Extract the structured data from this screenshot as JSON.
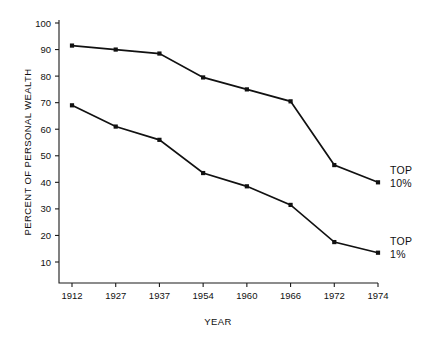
{
  "chart_data": {
    "type": "line",
    "title": "",
    "xlabel": "YEAR",
    "ylabel": "PERCENT OF PERSONAL WEALTH",
    "categories": [
      "1912",
      "1927",
      "1937",
      "1954",
      "1960",
      "1966",
      "1972",
      "1974"
    ],
    "ylim": [
      0,
      100
    ],
    "yticks": [
      10,
      20,
      30,
      40,
      50,
      60,
      70,
      80,
      90,
      100
    ],
    "ytick_labels": [
      "10",
      "20",
      "30",
      "40",
      "50",
      "60",
      "70",
      "80",
      "90",
      "100"
    ],
    "grid": false,
    "legend_position": "right-inline",
    "series": [
      {
        "name": "TOP 10%",
        "label_line1": "TOP",
        "label_line2": "10%",
        "color": "#111111",
        "values": [
          91.5,
          90,
          88.5,
          79.5,
          75,
          70.5,
          46.5,
          40
        ]
      },
      {
        "name": "TOP 1%",
        "label_line1": "TOP",
        "label_line2": "1%",
        "color": "#111111",
        "values": [
          69,
          61,
          56,
          43.5,
          38.5,
          31.5,
          17.5,
          13.5
        ]
      }
    ]
  }
}
